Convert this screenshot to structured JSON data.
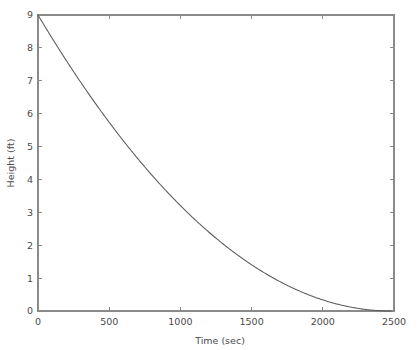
{
  "chart_data": {
    "type": "line",
    "title": "",
    "xlabel": "Time (sec)",
    "ylabel": "Height (ft)",
    "xlim": [
      0,
      2500
    ],
    "ylim": [
      0,
      9
    ],
    "grid": false,
    "legend": null,
    "xticks": [
      0,
      500,
      1000,
      1500,
      2000,
      2500
    ],
    "xticklabels": [
      "0",
      "500",
      "1000",
      "1500",
      "2000",
      "2500"
    ],
    "yticks": [
      0,
      1,
      2,
      3,
      4,
      5,
      6,
      7,
      8,
      9
    ],
    "yticklabels": [
      "0",
      "1",
      "2",
      "3",
      "4",
      "5",
      "6",
      "7",
      "8",
      "9"
    ],
    "line_color": "#5a5a5a",
    "axis_color": "#8a8a8a",
    "background_color": "#ffffff",
    "series": [
      {
        "name": "Height",
        "x": [
          0,
          100,
          200,
          300,
          400,
          500,
          600,
          700,
          800,
          900,
          1000,
          1100,
          1200,
          1300,
          1400,
          1500,
          1600,
          1700,
          1800,
          1900,
          2000,
          2100,
          2200,
          2300,
          2400,
          2450,
          2480
        ],
        "y": [
          9.0,
          8.29,
          7.61,
          6.95,
          6.32,
          5.72,
          5.14,
          4.59,
          4.07,
          3.57,
          3.1,
          2.66,
          2.24,
          1.85,
          1.49,
          1.16,
          0.85,
          0.58,
          0.33,
          0.11,
          1.85,
          0.0,
          0.0,
          0.0,
          0.0,
          0.0,
          0.0
        ]
      }
    ],
    "model": {
      "description": "Torricelli tank drain",
      "h0": 9.0,
      "t_empty": 2480,
      "formula": "h(t) = h0 * (1 - t/t_empty)^2"
    },
    "sampled_points": [
      {
        "t": 0,
        "h": 9.0
      },
      {
        "t": 500,
        "h": 6.5
      },
      {
        "t": 1000,
        "h": 4.94
      },
      {
        "t": 1500,
        "h": 3.3
      },
      {
        "t": 2000,
        "h": 1.85
      },
      {
        "t": 2480,
        "h": 0.0
      }
    ]
  }
}
